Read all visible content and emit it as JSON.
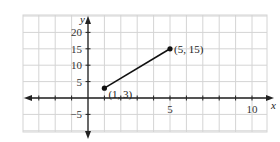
{
  "chart_data": {
    "type": "line",
    "title": "",
    "xlabel": "x",
    "ylabel": "y",
    "xlim": [
      -4,
      11
    ],
    "ylim": [
      -10,
      25
    ],
    "grid": true,
    "x_ticks": [
      {
        "value": 5,
        "label": "5"
      },
      {
        "value": 10,
        "label": "10"
      }
    ],
    "y_ticks": [
      {
        "value": 20,
        "label": "20"
      },
      {
        "value": 15,
        "label": "15"
      },
      {
        "value": 10,
        "label": "10"
      },
      {
        "value": 5,
        "label": "5"
      },
      {
        "value": -5,
        "label": "−5"
      }
    ],
    "series": [
      {
        "name": "segment",
        "x": [
          1,
          5
        ],
        "y": [
          3,
          15
        ]
      }
    ],
    "annotations": [
      {
        "text": "(1, 3)",
        "x": 1,
        "y": 3
      },
      {
        "text": "(5, 15)",
        "x": 5,
        "y": 15
      }
    ],
    "colors": {
      "grid": "#d4d4d4",
      "axis": "#222222",
      "line": "#111111"
    }
  }
}
